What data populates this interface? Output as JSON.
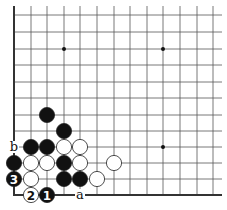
{
  "diagram": {
    "type": "go-board-fragment",
    "grid": {
      "x_positions": [
        14,
        31,
        47,
        64,
        80,
        97,
        114,
        130,
        147,
        163,
        180,
        197,
        213
      ],
      "y_positions": [
        15,
        32,
        49,
        65,
        82,
        98,
        115,
        131,
        147,
        163,
        179,
        195
      ],
      "right_extent": 222,
      "top_extent": 6,
      "left_edge_thick": true,
      "bottom_edge_thick": true,
      "line_color": "#555555",
      "edge_color": "#333333"
    },
    "star_points": [
      {
        "col": 3,
        "row": 2
      },
      {
        "col": 9,
        "row": 2
      },
      {
        "col": 9,
        "row": 8
      }
    ],
    "stones": [
      {
        "color": "black",
        "col": 2,
        "row": 6,
        "label": ""
      },
      {
        "color": "black",
        "col": 3,
        "row": 7,
        "label": ""
      },
      {
        "color": "black",
        "col": 1,
        "row": 8,
        "label": ""
      },
      {
        "color": "black",
        "col": 2,
        "row": 8,
        "label": ""
      },
      {
        "color": "white",
        "col": 3,
        "row": 8,
        "label": ""
      },
      {
        "color": "white",
        "col": 4,
        "row": 8,
        "label": ""
      },
      {
        "color": "black",
        "col": 0,
        "row": 9,
        "label": ""
      },
      {
        "color": "white",
        "col": 1,
        "row": 9,
        "label": ""
      },
      {
        "color": "white",
        "col": 2,
        "row": 9,
        "label": ""
      },
      {
        "color": "black",
        "col": 3,
        "row": 9,
        "label": ""
      },
      {
        "color": "white",
        "col": 4,
        "row": 9,
        "label": ""
      },
      {
        "color": "white",
        "col": 6,
        "row": 9,
        "label": ""
      },
      {
        "color": "black",
        "col": 0,
        "row": 10,
        "label": "3"
      },
      {
        "color": "white",
        "col": 1,
        "row": 10,
        "label": ""
      },
      {
        "color": "black",
        "col": 3,
        "row": 10,
        "label": ""
      },
      {
        "color": "black",
        "col": 4,
        "row": 10,
        "label": ""
      },
      {
        "color": "white",
        "col": 5,
        "row": 10,
        "label": ""
      },
      {
        "color": "white",
        "col": 1,
        "row": 11,
        "label": "2"
      },
      {
        "color": "black",
        "col": 2,
        "row": 11,
        "label": "1"
      }
    ],
    "point_labels": [
      {
        "text": "a",
        "col": 4,
        "row": 11
      },
      {
        "text": "b",
        "col": 0,
        "row": 8
      }
    ],
    "stone_colors": {
      "black": "#111111",
      "white": "#ffffff",
      "outline": "#222222"
    }
  }
}
